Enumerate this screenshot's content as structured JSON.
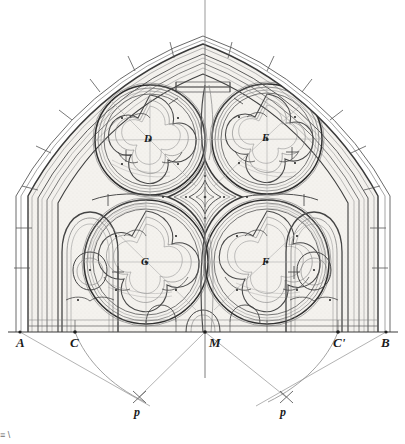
{
  "figure": {
    "type": "architectural-geometric-drawing",
    "width": 405,
    "height": 444,
    "background_color": "#ffffff",
    "line_color": "#5a5a5a",
    "dark_line_color": "#2e2e2e",
    "construction_line_color": "#9a9a9a",
    "fill_tint": "#f2f0ec",
    "caption_fragment": "≡ \\"
  },
  "labels": {
    "baseline": [
      {
        "id": "A",
        "text": "A",
        "x": 16,
        "y": 336,
        "kind": "baseline-point"
      },
      {
        "id": "C",
        "text": "C",
        "x": 70,
        "y": 336,
        "kind": "baseline-point"
      },
      {
        "id": "M",
        "text": "M",
        "x": 209,
        "y": 336,
        "kind": "baseline-center"
      },
      {
        "id": "Cp",
        "text": "C'",
        "x": 333,
        "y": 336,
        "kind": "baseline-point"
      },
      {
        "id": "B",
        "text": "B",
        "x": 381,
        "y": 336,
        "kind": "baseline-point"
      }
    ],
    "centers": [
      {
        "id": "D",
        "text": "D",
        "x": 144,
        "y": 133,
        "kind": "circle-center-upper-left"
      },
      {
        "id": "E",
        "text": "E",
        "x": 262,
        "y": 132,
        "kind": "circle-center-upper-right"
      },
      {
        "id": "G",
        "text": "G",
        "x": 141,
        "y": 256,
        "kind": "circle-center-lower-left"
      },
      {
        "id": "F",
        "text": "F",
        "x": 262,
        "y": 256,
        "kind": "circle-center-lower-right"
      }
    ],
    "pivots": [
      {
        "id": "p-left",
        "text": "p",
        "x": 134,
        "y": 406,
        "kind": "arc-pivot"
      },
      {
        "id": "p-right",
        "text": "p",
        "x": 280,
        "y": 406,
        "kind": "arc-pivot"
      }
    ]
  },
  "geometry": {
    "baseline_y": 332,
    "axis_x": 203,
    "span_A_x": 20,
    "span_B_x": 386,
    "inner_C_x": 75,
    "inner_Cp_x": 338,
    "apex_y": 38,
    "pivot_left": {
      "x": 139,
      "y": 397
    },
    "pivot_right": {
      "x": 286,
      "y": 397
    },
    "circles": [
      {
        "name": "upper-left",
        "cx": 150,
        "cy": 140,
        "r": 55
      },
      {
        "name": "upper-right",
        "cx": 267,
        "cy": 139,
        "r": 55
      },
      {
        "name": "lower-left",
        "cx": 146,
        "cy": 262,
        "r": 62
      },
      {
        "name": "lower-right",
        "cx": 267,
        "cy": 262,
        "r": 62
      }
    ],
    "central_motif": {
      "cx": 205,
      "cy": 196,
      "type": "quatrefoil-star"
    }
  }
}
